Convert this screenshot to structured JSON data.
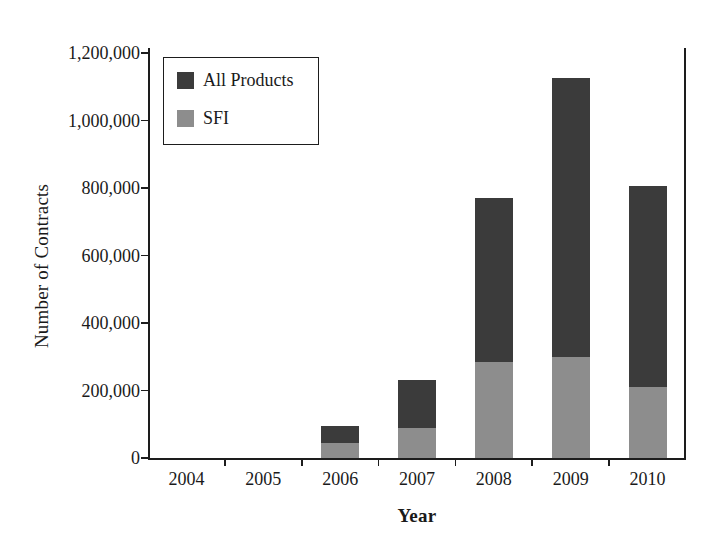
{
  "chart_data": {
    "type": "bar",
    "subtype": "stacked-vertical",
    "title": "",
    "xlabel": "Year",
    "ylabel": "Number of Contracts",
    "categories": [
      "2004",
      "2005",
      "2006",
      "2007",
      "2008",
      "2009",
      "2010"
    ],
    "series": [
      {
        "name": "SFI",
        "color": "#8d8d8d",
        "values": [
          0,
          0,
          45000,
          90000,
          285000,
          300000,
          210000
        ]
      },
      {
        "name": "All Products",
        "color": "#3b3b3b",
        "values": [
          0,
          0,
          95000,
          230000,
          770000,
          1125000,
          805000
        ]
      }
    ],
    "stacking_note": "The 'All Products' value is the total bar height; the 'SFI' value is the lower shaded portion of the same bar.",
    "ylim": [
      0,
      1200000
    ],
    "yticks": [
      0,
      200000,
      400000,
      600000,
      800000,
      1000000,
      1200000
    ],
    "ytick_labels": [
      "0",
      "200,000",
      "400,000",
      "600,000",
      "800,000",
      "1,000,000",
      "1,200,000"
    ],
    "grid": false,
    "legend_position": "top-left-inside",
    "legend_entries": [
      "All Products",
      "SFI"
    ]
  },
  "axes": {
    "y_title": "Number of Contracts",
    "x_title": "Year"
  },
  "legend": {
    "items": [
      {
        "label": "All Products",
        "swatch": "#3b3b3b"
      },
      {
        "label": "SFI",
        "swatch": "#8d8d8d"
      }
    ]
  },
  "colors": {
    "all_products": "#3b3b3b",
    "sfi": "#8d8d8d",
    "axis": "#1d1d1d",
    "background": "#ffffff"
  }
}
